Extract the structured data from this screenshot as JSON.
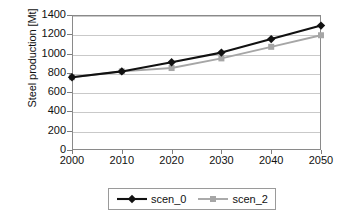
{
  "chart_data": {
    "type": "line",
    "title": "",
    "xlabel": "",
    "ylabel": "Steel production [Mt]",
    "x": [
      2000,
      2010,
      2020,
      2030,
      2040,
      2050
    ],
    "xtick_labels": [
      "2000",
      "2010",
      "2020",
      "2030",
      "2040",
      "2050"
    ],
    "ytick_labels": [
      "0",
      "200",
      "400",
      "600",
      "800",
      "1000",
      "1200",
      "1400"
    ],
    "yticks": [
      0,
      200,
      400,
      600,
      800,
      1000,
      1200,
      1400
    ],
    "ylim": [
      0,
      1400
    ],
    "xlim": [
      2000,
      2050
    ],
    "grid": "horizontal",
    "legend_position": "bottom-center",
    "series": [
      {
        "name": "scen_0",
        "values": [
          755,
          815,
          910,
          1010,
          1150,
          1290
        ],
        "color": "#111111",
        "marker": "diamond"
      },
      {
        "name": "scen_2",
        "values": [
          755,
          815,
          850,
          950,
          1070,
          1190
        ],
        "color": "#a6a6a6",
        "marker": "square"
      }
    ]
  },
  "axes": {
    "y_title": "Steel production [Mt]"
  },
  "legend": {
    "entries": [
      {
        "label": "scen_0"
      },
      {
        "label": "scen_2"
      }
    ]
  }
}
